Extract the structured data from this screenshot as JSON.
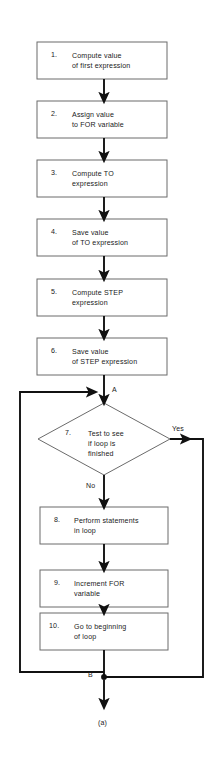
{
  "diagram": {
    "type": "flowchart",
    "caption": "(a)",
    "connector_labels": {
      "a": "A",
      "b": "B",
      "yes": "Yes",
      "no": "No"
    },
    "nodes": [
      {
        "id": "n1",
        "number": "1.",
        "shape": "process",
        "lines": [
          "Compute value",
          "of first  expression"
        ]
      },
      {
        "id": "n2",
        "number": "2.",
        "shape": "process",
        "lines": [
          "Assign value",
          "to FOR variable"
        ]
      },
      {
        "id": "n3",
        "number": "3.",
        "shape": "process",
        "lines": [
          "Compute TO",
          "expression"
        ]
      },
      {
        "id": "n4",
        "number": "4.",
        "shape": "process",
        "lines": [
          "Save value",
          "of TO expression"
        ]
      },
      {
        "id": "n5",
        "number": "5.",
        "shape": "process",
        "lines": [
          "Compute STEP",
          "expression"
        ]
      },
      {
        "id": "n6",
        "number": "6.",
        "shape": "process",
        "lines": [
          "Save value",
          "of STEP expression"
        ]
      },
      {
        "id": "n7",
        "number": "7.",
        "shape": "decision",
        "lines": [
          "Test to see",
          "if loop is",
          "finished"
        ]
      },
      {
        "id": "n8",
        "number": "8.",
        "shape": "process",
        "lines": [
          "Perform statements",
          "in loop"
        ]
      },
      {
        "id": "n9",
        "number": "9.",
        "shape": "process",
        "lines": [
          "Increment FOR",
          "variable"
        ]
      },
      {
        "id": "n10",
        "number": "10.",
        "shape": "process",
        "lines": [
          "Go to beginning",
          "of loop"
        ]
      }
    ],
    "colors": {
      "stroke": "#6b6b6b",
      "connector": "#111111",
      "text": "#1a1a1a",
      "background": "#ffffff"
    }
  }
}
